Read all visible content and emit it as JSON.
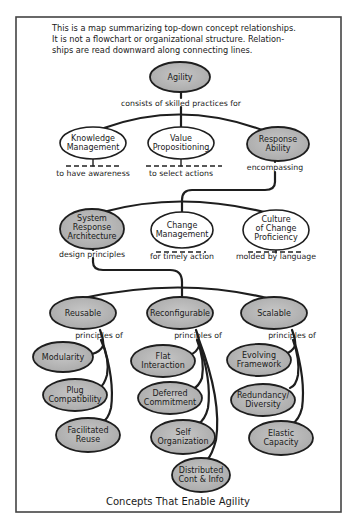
{
  "intro": {
    "lines": [
      "This is a map summarizing top-down concept relationships.",
      "It is not a flowchart or organizational structure.  Relation-",
      "ships are read downward along connecting lines."
    ]
  },
  "colors": {
    "shaded_node": "#b9b9b9",
    "plain_node": "#ffffff",
    "stroke": "#1e1e1e",
    "frame": "#444444"
  },
  "root": {
    "label": "Agility",
    "shaded": true,
    "link_label": "consists of skilled practices for"
  },
  "level1": [
    {
      "lines": [
        "Knowledge",
        "Management"
      ],
      "shaded": false,
      "annotation": "to have awareness"
    },
    {
      "lines": [
        "Value",
        "Propositioning"
      ],
      "shaded": false,
      "annotation": "to select actions"
    },
    {
      "lines": [
        "Response",
        "Ability"
      ],
      "shaded": true,
      "annotation": "encompassing"
    }
  ],
  "level2": [
    {
      "lines": [
        "System",
        "Response",
        "Architecture"
      ],
      "shaded": true,
      "annotation": "design principles"
    },
    {
      "lines": [
        "Change",
        "Management"
      ],
      "shaded": false,
      "annotation": "for timely action"
    },
    {
      "lines": [
        "Culture",
        "of Change",
        "Proficiency"
      ],
      "shaded": false,
      "annotation": "molded by language"
    }
  ],
  "level3": [
    {
      "label": "Reusable",
      "link_label": "principles of",
      "children": [
        {
          "lines": [
            "Modularity"
          ]
        },
        {
          "lines": [
            "Plug",
            "Compatibility"
          ]
        },
        {
          "lines": [
            "Facilitated",
            "Reuse"
          ]
        }
      ]
    },
    {
      "label": "Reconfigurable",
      "link_label": "principles of",
      "children": [
        {
          "lines": [
            "Flat",
            "Interaction"
          ]
        },
        {
          "lines": [
            "Deferred",
            "Commitment"
          ]
        },
        {
          "lines": [
            "Self",
            "Organization"
          ]
        },
        {
          "lines": [
            "Distributed",
            "Cont & Info"
          ]
        }
      ]
    },
    {
      "label": "Scalable",
      "link_label": "principles of",
      "children": [
        {
          "lines": [
            "Evolving",
            "Framework"
          ]
        },
        {
          "lines": [
            "Redundancy/",
            "Diversity"
          ]
        },
        {
          "lines": [
            "Elastic",
            "Capacity"
          ]
        }
      ]
    }
  ],
  "caption": "Concepts That Enable Agility"
}
